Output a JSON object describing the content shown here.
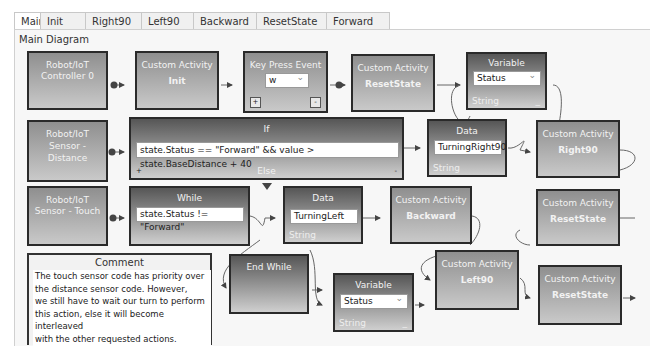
{
  "tabs": [
    "Main",
    "Init",
    "Right90",
    "Left90",
    "Backward",
    "ResetState",
    "Forward"
  ],
  "active_tab": "Main",
  "diagram_title": "Main Diagram",
  "nodes": {
    "controller": {
      "line1": "Robot/IoT",
      "line2": "Controller 0"
    },
    "init": {
      "title": "Custom Activity",
      "name": "Init"
    },
    "keypress": {
      "title": "Key Press Event",
      "key": "w",
      "plus": "+",
      "minus": "-"
    },
    "reset1": {
      "title": "Custom Activity",
      "name": "ResetState"
    },
    "var1": {
      "title": "Variable",
      "value": "Status",
      "type": "String",
      "dash": "_"
    },
    "distance": {
      "line1": "Robot/IoT",
      "line2": "Sensor -",
      "line3": "Distance"
    },
    "if": {
      "title": "If",
      "condition": "state.Status == \"Forward\" && value > state.BaseDistance + 40",
      "else": "Else",
      "plus": "+",
      "minus": "-"
    },
    "data1": {
      "title": "Data",
      "value": "TurningRight90",
      "type": "String"
    },
    "right90": {
      "title": "Custom Activity",
      "name": "Right90"
    },
    "touch": {
      "line1": "Robot/IoT",
      "line2": "Sensor - Touch"
    },
    "while": {
      "title": "While",
      "condition": "state.Status != \"Forward\""
    },
    "data2": {
      "title": "Data",
      "value": "TurningLeft",
      "type": "String"
    },
    "backward": {
      "title": "Custom Activity",
      "name": "Backward"
    },
    "reset2": {
      "title": "Custom Activity",
      "name": "ResetState"
    },
    "endwhile": {
      "title": "End While"
    },
    "var2": {
      "title": "Variable",
      "value": "Status",
      "type": "String",
      "dash": "_"
    },
    "left90": {
      "title": "Custom Activity",
      "name": "Left90"
    },
    "reset3": {
      "title": "Custom Activity",
      "name": "ResetState"
    }
  },
  "comment": {
    "title": "Comment",
    "body": "The touch sensor code has priority over\nthe distance sensor code. However,\nwe still have to wait our turn to perform\nthis action, else it will become interleaved\nwith the other requested actions."
  }
}
